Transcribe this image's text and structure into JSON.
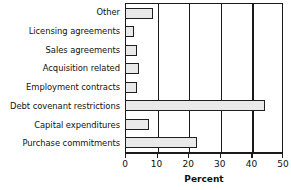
{
  "chart_data": {
    "type": "bar",
    "orientation": "horizontal",
    "title": "",
    "xlabel": "Percent",
    "ylabel": "",
    "xlim": [
      0,
      50
    ],
    "xticks": [
      0,
      10,
      20,
      30,
      40,
      50
    ],
    "xtick_labels": [
      "0",
      "10",
      "20",
      "30",
      "40",
      "50"
    ],
    "grid": true,
    "grid_axis": "x",
    "legend": false,
    "categories": [
      "Other",
      "Licensing agreements",
      "Sales agreements",
      "Acquisition related",
      "Employment contracts",
      "Debt covenant restrictions",
      "Capital expenditures",
      "Purchase commitments"
    ],
    "values": [
      9,
      3,
      4,
      4.5,
      3.8,
      44.5,
      7.5,
      23
    ],
    "bar_fill_color": "#e9e9e9",
    "bar_edge_color": "#1f1f1f",
    "axis_color": "#1a1a1a",
    "background_color": "#ffffff"
  }
}
